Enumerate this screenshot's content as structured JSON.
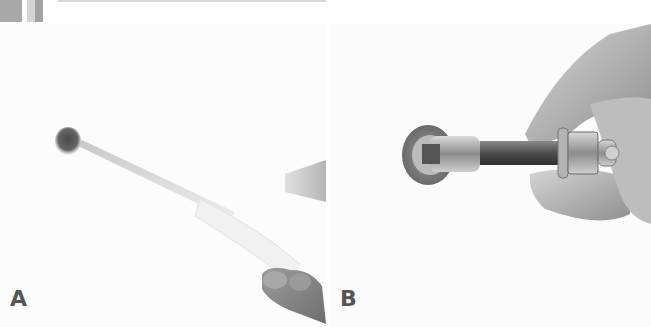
{
  "figure": {
    "header": {
      "accent_colors": [
        "#a9a9a9",
        "#d4d4d4",
        "#a2a2a2"
      ]
    },
    "panels": [
      {
        "label": "A",
        "description": "Hand holding a drill with a long white bit, drilling a hole into a white wall",
        "tone": "grayscale"
      },
      {
        "label": "B",
        "description": "Hand inserting a wedge anchor bolt with nut and washer into a drilled hole in the wall",
        "tone": "grayscale"
      }
    ]
  }
}
